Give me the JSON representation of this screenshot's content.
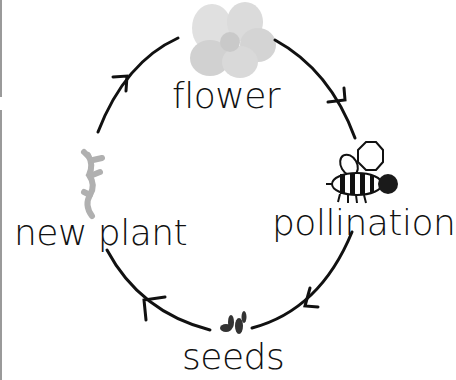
{
  "diagram": {
    "stages": [
      {
        "id": "flower",
        "label": "flower",
        "icon": "flower-icon"
      },
      {
        "id": "pollination",
        "label": "pollination",
        "icon": "bee-icon"
      },
      {
        "id": "seeds",
        "label": "seeds",
        "icon": "seeds-icon"
      },
      {
        "id": "new-plant",
        "label": "new plant",
        "icon": "sprout-icon"
      }
    ],
    "flow": [
      "flower",
      "pollination",
      "seeds",
      "new-plant",
      "flower"
    ],
    "colors": {
      "arrow": "#111111",
      "text": "#111111",
      "flower": "#c8c8c8",
      "sprout": "#b0b0b0",
      "bee": "#1a1a1a",
      "seeds": "#333333"
    }
  }
}
